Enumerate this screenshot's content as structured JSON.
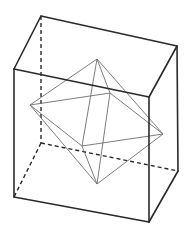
{
  "figure": {
    "colors": {
      "cube_edge": "#2a2a2a",
      "octahedron_edge": "#6e6e6e",
      "background": "#ffffff"
    },
    "cube": {
      "vertices": {
        "FTL": [
          14,
          69
        ],
        "FTR": [
          149,
          97
        ],
        "FBL": [
          14,
          197
        ],
        "FBR": [
          149,
          222
        ],
        "BTL": [
          41,
          16
        ],
        "BTR": [
          177,
          46
        ],
        "BBL": [
          41,
          143
        ],
        "BBR": [
          178,
          171
        ]
      },
      "visible_edges": [
        [
          "FTL",
          "FTR"
        ],
        [
          "FTR",
          "FBR"
        ],
        [
          "FBR",
          "FBL"
        ],
        [
          "FBL",
          "FTL"
        ],
        [
          "FTL",
          "BTL"
        ],
        [
          "BTL",
          "BTR"
        ],
        [
          "BTR",
          "FTR"
        ],
        [
          "BTR",
          "BBR"
        ],
        [
          "BBR",
          "FBR"
        ]
      ],
      "hidden_edges": [
        [
          "BTL",
          "BBL"
        ],
        [
          "BBL",
          "BBR"
        ],
        [
          "BBL",
          "FBL"
        ]
      ]
    },
    "octahedron": {
      "vertices": {
        "top": [
          97,
          59
        ],
        "bottom": [
          97,
          184
        ],
        "left": [
          30,
          105
        ],
        "right": [
          163,
          134
        ],
        "back": [
          110,
          93
        ],
        "front": [
          82,
          146
        ]
      },
      "edges": [
        [
          "top",
          "left"
        ],
        [
          "top",
          "right"
        ],
        [
          "top",
          "back"
        ],
        [
          "top",
          "front"
        ],
        [
          "bottom",
          "left"
        ],
        [
          "bottom",
          "right"
        ],
        [
          "bottom",
          "back"
        ],
        [
          "bottom",
          "front"
        ],
        [
          "left",
          "back"
        ],
        [
          "back",
          "right"
        ],
        [
          "right",
          "front"
        ],
        [
          "front",
          "left"
        ]
      ]
    }
  }
}
